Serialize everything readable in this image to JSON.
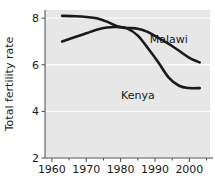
{
  "chart_data": {
    "type": "line",
    "title": "",
    "subtitle": "",
    "xlabel": "",
    "ylabel": "Total fertility rate",
    "xlim": [
      1958,
      2006
    ],
    "ylim": [
      2,
      8.35
    ],
    "grid": true,
    "grid_color": "#ffffff",
    "plot_background": "#e7e7e7",
    "line_color": "#1a1a1a",
    "legend_position": "inline-annotations",
    "x_ticks": [
      1960,
      1970,
      1980,
      1990,
      2000
    ],
    "x_tick_labels": [
      "1960",
      "1970",
      "1980",
      "1990",
      "2000"
    ],
    "x_minor_ticks": [
      1965,
      1975,
      1985,
      1995,
      2005
    ],
    "y_ticks": [
      2,
      4,
      6,
      8
    ],
    "y_tick_labels": [
      "2",
      "4",
      "6",
      "8"
    ],
    "series": [
      {
        "name": "Malawi",
        "label": "Malawi",
        "label_x": 1994,
        "label_y": 6.95,
        "x": [
          1963,
          1967,
          1970,
          1973,
          1976,
          1979,
          1982,
          1985,
          1988,
          1991,
          1994,
          1997,
          2000,
          2003
        ],
        "values": [
          8.1,
          8.08,
          8.05,
          8.0,
          7.85,
          7.65,
          7.58,
          7.55,
          7.4,
          7.15,
          6.9,
          6.6,
          6.3,
          6.1
        ]
      },
      {
        "name": "Kenya",
        "label": "Kenya",
        "label_x": 1985,
        "label_y": 4.55,
        "x": [
          1963,
          1967,
          1970,
          1973,
          1976,
          1979,
          1982,
          1985,
          1988,
          1991,
          1994,
          1997,
          2000,
          2003
        ],
        "values": [
          7.0,
          7.2,
          7.35,
          7.5,
          7.6,
          7.62,
          7.55,
          7.25,
          6.7,
          6.1,
          5.45,
          5.1,
          5.0,
          5.0
        ]
      }
    ]
  }
}
